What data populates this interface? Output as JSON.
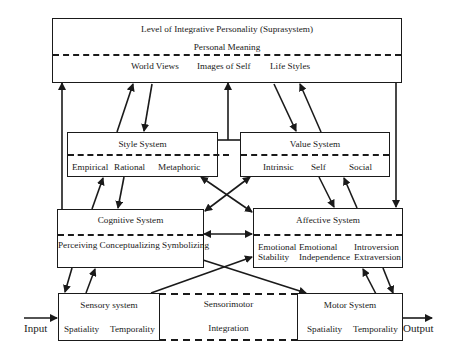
{
  "diagram": {
    "suprasystem": {
      "title": "Level of Integrative Personality (Suprasystem)",
      "subtitle": "Personal Meaning",
      "items": [
        "World Views",
        "Images of Self",
        "Life Styles"
      ]
    },
    "style_system": {
      "title": "Style System",
      "items": [
        "Empirical",
        "Rational",
        "Metaphoric"
      ]
    },
    "value_system": {
      "title": "Value System",
      "items": [
        "Intrinsic",
        "Self",
        "Social"
      ]
    },
    "cognitive_system": {
      "title": "Cognitive System",
      "items": [
        "Perceiving Conceptualizing Symbolizing"
      ]
    },
    "affective_system": {
      "title": "Affective System",
      "items": [
        {
          "line1": "Emotional",
          "line2": "Stability"
        },
        {
          "line1": "Emotional",
          "line2": "Independence"
        },
        {
          "line1": "Introversion",
          "line2": "Extraversion"
        }
      ]
    },
    "sensory_system": {
      "title": "Sensory system",
      "items": [
        "Spatiality",
        "Temporality"
      ]
    },
    "sensorimotor": {
      "title": "Sensorimotor",
      "subtitle": "Integration"
    },
    "motor_system": {
      "title": "Motor System",
      "items": [
        "Spatiality",
        "Temporality"
      ]
    },
    "input_label": "Input",
    "output_label": "Output",
    "colors": {
      "line": "#1a1a1a",
      "background": "#ffffff"
    }
  }
}
